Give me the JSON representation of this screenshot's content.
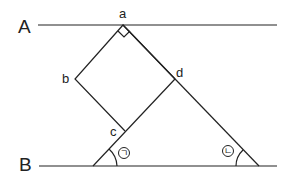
{
  "labels": {
    "line_a": "A",
    "line_b": "B",
    "point_a": "a",
    "point_b": "b",
    "point_c": "c",
    "point_d": "d",
    "angle_1": "ㄱ",
    "angle_2": "ㄴ"
  },
  "geometry": {
    "line_A_y": 25,
    "line_B_y": 166,
    "square_vertices": {
      "a": [
        123,
        25
      ],
      "b": [
        75,
        79
      ],
      "c": [
        125,
        131
      ],
      "d": [
        175,
        79
      ]
    },
    "triangle_base": [
      [
        93,
        166
      ],
      [
        258,
        166
      ]
    ],
    "right_angle_at": "a"
  }
}
